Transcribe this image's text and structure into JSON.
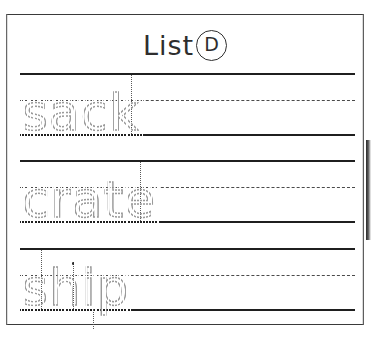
{
  "worksheet": {
    "title": {
      "label": "List",
      "badge_letter": "D"
    },
    "page_border_color": "#3a3a3a",
    "rule_color": "#1f1f1f",
    "dashed_rule_color": "#4a4a4a",
    "trace_color": "#9a9a9a",
    "lines": [
      {
        "index": 1,
        "word": "sack",
        "top_rule_y": 73,
        "midline_y": 100,
        "baseline_y": 134
      },
      {
        "index": 2,
        "word": "crate",
        "top_rule_y": 160,
        "midline_y": 187,
        "baseline_y": 221
      },
      {
        "index": 3,
        "word": "ship",
        "top_rule_y": 248,
        "midline_y": 275,
        "baseline_y": 309
      }
    ]
  }
}
